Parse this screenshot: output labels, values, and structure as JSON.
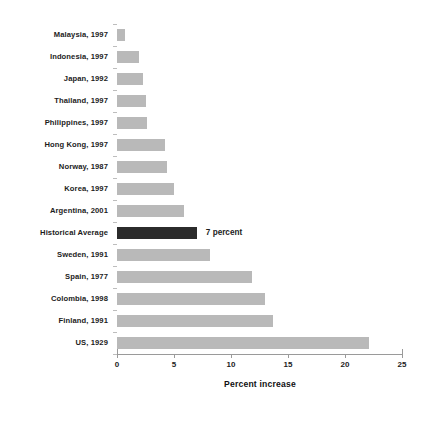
{
  "chart_data": {
    "type": "bar",
    "orientation": "horizontal",
    "title": "",
    "xlabel": "Percent increase",
    "ylabel": "",
    "xlim": [
      0,
      25
    ],
    "xticks": [
      0,
      5,
      10,
      15,
      20,
      25
    ],
    "xtick_labels": [
      "0",
      "5",
      "10",
      "15",
      "20",
      "25"
    ],
    "grid": false,
    "legend": "none",
    "categories": [
      "Malaysia, 1997",
      "Indonesia, 1997",
      "Japan, 1992",
      "Thailand, 1997",
      "Philippines, 1997",
      "Hong Kong, 1997",
      "Norway, 1987",
      "Korea, 1997",
      "Argentina, 2001",
      "Historical Average",
      "Sweden, 1991",
      "Spain, 1977",
      "Colombia, 1998",
      "Finland, 1991",
      "US, 1929"
    ],
    "values": [
      0.7,
      1.9,
      2.3,
      2.5,
      2.6,
      4.2,
      4.4,
      5.0,
      5.9,
      7.0,
      8.2,
      11.8,
      13.0,
      13.7,
      22.1
    ],
    "highlight_index": 9,
    "annotations": [
      {
        "index": 9,
        "text": "7 percent"
      }
    ],
    "colors": {
      "bar": "#b9b9b9",
      "highlight_bar": "#2b2b2b",
      "axis": "#9a9a9a",
      "text": "#1c1c1c",
      "background": "#ffffff"
    }
  }
}
